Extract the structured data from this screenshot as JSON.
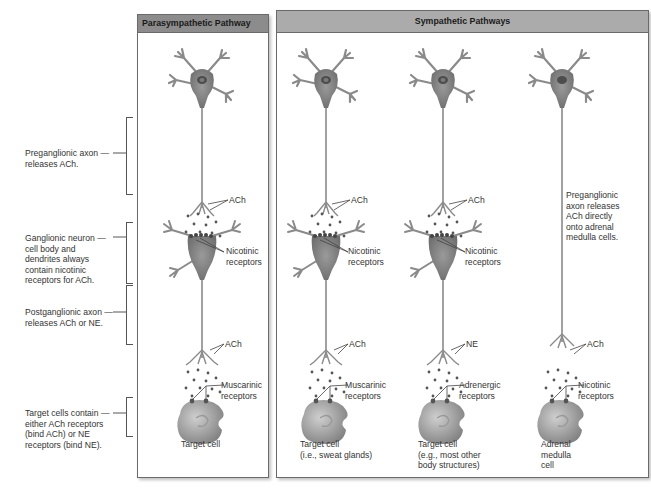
{
  "panels": {
    "parasympathetic": {
      "title": "Parasympathetic Pathway",
      "header_color": "#8c8c8c"
    },
    "sympathetic": {
      "title": "Sympathetic Pathways",
      "header_color": "#ababab"
    }
  },
  "side_labels": {
    "preganglionic": "Preganglionic axon releases ACh.",
    "ganglionic": "Ganglionic neuron cell body and dendrites always contain nicotinic receptors for ACh.",
    "postganglionic": "Postganglionic axon releases ACh or NE.",
    "target": "Target cells contain either ACh receptors (bind ACh) or NE receptors (bind NE)."
  },
  "columns": [
    {
      "pathway": "parasympathetic",
      "upper_nt": "ACh",
      "ganglion_receptor": "Nicotinic receptors",
      "lower_nt": "ACh",
      "target_receptor": "Muscarinic receptors",
      "target_label": "Target cell"
    },
    {
      "pathway": "sympathetic",
      "upper_nt": "ACh",
      "ganglion_receptor": "Nicotinic receptors",
      "lower_nt": "ACh",
      "target_receptor": "Muscarinic receptors",
      "target_label": "Target cell (i.e., sweat glands)"
    },
    {
      "pathway": "sympathetic",
      "upper_nt": "ACh",
      "ganglion_receptor": "Nicotinic receptors",
      "lower_nt": "NE",
      "target_receptor": "Adrenergic receptors",
      "target_label": "Target cell (e.g., most other body structures)"
    },
    {
      "pathway": "sympathetic",
      "note": "Preganglionic axon releases ACh directly onto adrenal medulla cells.",
      "lower_nt": "ACh",
      "target_receptor": "Nicotinic receptors",
      "target_label": "Adrenal medulla cell"
    }
  ],
  "split_labels": {
    "c0_gr": [
      "Nicotinic",
      "receptors"
    ],
    "c1_gr": [
      "Nicotinic",
      "receptors"
    ],
    "c2_gr": [
      "Nicotinic",
      "receptors"
    ],
    "c0_tr": [
      "Muscarinic",
      "receptors"
    ],
    "c1_tr": [
      "Muscarinic",
      "receptors"
    ],
    "c2_tr": [
      "Adrenergic",
      "receptors"
    ],
    "c3_tr": [
      "Nicotinic",
      "receptors"
    ],
    "c0_tl": [
      "Target cell"
    ],
    "c1_tl": [
      "Target cell",
      "(i.e., sweat glands)"
    ],
    "c2_tl": [
      "Target cell",
      "(e.g., most other",
      "body structures)"
    ],
    "c3_tl": [
      "Adrenal",
      "medulla",
      "cell"
    ],
    "c3_note": [
      "Preganglionic",
      "axon releases",
      "ACh directly",
      "onto adrenal",
      "medulla cells."
    ],
    "side_pre": [
      "Preganglionic axon —",
      "releases ACh."
    ],
    "side_gang": [
      "Ganglionic neuron —",
      "cell body and",
      "dendrites always",
      "contain nicotinic",
      "receptors for ACh."
    ],
    "side_post": [
      "Postganglionic axon —",
      "releases ACh or NE."
    ],
    "side_target": [
      "Target cells contain —",
      "either ACh receptors",
      "(bind ACh) or NE",
      "receptors (bind NE)."
    ]
  },
  "colors": {
    "neuron": "#8a8a8a",
    "neuron_dark": "#5a5a5a",
    "frame": "#6a6a6a",
    "text": "#333333"
  }
}
